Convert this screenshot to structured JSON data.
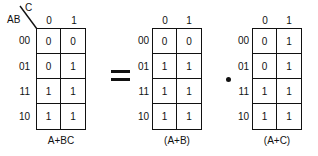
{
  "diagram": {
    "operators": {
      "equals": "=",
      "and": "•"
    },
    "maps": [
      {
        "id": "left",
        "row_var": "AB",
        "col_var": "C",
        "col_labels": [
          "0",
          "1"
        ],
        "row_labels": [
          "00",
          "01",
          "11",
          "10"
        ],
        "cells": [
          [
            "0",
            "0"
          ],
          [
            "0",
            "1"
          ],
          [
            "1",
            "1"
          ],
          [
            "1",
            "1"
          ]
        ],
        "caption": "A+BC"
      },
      {
        "id": "middle",
        "col_labels": [
          "0",
          "1"
        ],
        "row_labels": [
          "00",
          "01",
          "11",
          "10"
        ],
        "cells": [
          [
            "0",
            "0"
          ],
          [
            "1",
            "1"
          ],
          [
            "1",
            "1"
          ],
          [
            "1",
            "1"
          ]
        ],
        "caption": "(A+B)"
      },
      {
        "id": "right",
        "col_labels": [
          "0",
          "1"
        ],
        "row_labels": [
          "00",
          "01",
          "11",
          "10"
        ],
        "cells": [
          [
            "0",
            "1"
          ],
          [
            "0",
            "1"
          ],
          [
            "1",
            "1"
          ],
          [
            "1",
            "1"
          ]
        ],
        "caption": "(A+C)"
      }
    ]
  }
}
